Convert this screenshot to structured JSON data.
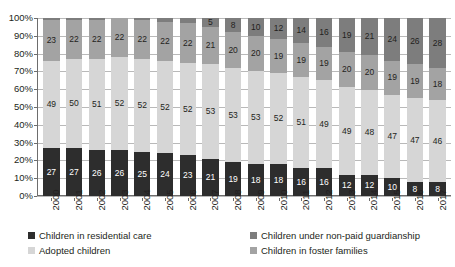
{
  "chart_data": {
    "type": "bar",
    "stacked": true,
    "stack_mode": "percent",
    "title": "",
    "subtitle": "",
    "xlabel": "",
    "ylabel": "",
    "ylim": [
      0,
      100
    ],
    "ytick_labels": [
      "100%",
      "90%",
      "80%",
      "70%",
      "60%",
      "50%",
      "40%",
      "30%",
      "20%",
      "10%",
      "0%"
    ],
    "ytick_values": [
      100,
      90,
      80,
      70,
      60,
      50,
      40,
      30,
      20,
      10,
      0
    ],
    "grid": true,
    "grid_axis": "y",
    "legend_position": "bottom",
    "categories": [
      "2000",
      "2001",
      "2002",
      "2003",
      "2004",
      "2005",
      "2006",
      "2007",
      "2008",
      "2009",
      "2010",
      "2011",
      "2012",
      "2013",
      "2014",
      "2015",
      "2016",
      "2017"
    ],
    "series": [
      {
        "name": "Children in residential care",
        "color": "#2d2d2d",
        "stack_index": 0,
        "values": [
          27,
          27,
          26,
          26,
          25,
          24,
          23,
          21,
          19,
          18,
          18,
          16,
          16,
          12,
          12,
          10,
          8,
          8
        ],
        "labels": [
          "27",
          "27",
          "26",
          "26",
          "25",
          "24",
          "23",
          "21",
          "19",
          "18",
          "18",
          "16",
          "16",
          "12",
          "12",
          "10",
          "8",
          "8"
        ]
      },
      {
        "name": "Adopted children",
        "color": "#d6d6d6",
        "stack_index": 1,
        "values": [
          49,
          50,
          51,
          52,
          52,
          52,
          52,
          53,
          53,
          53,
          52,
          51,
          49,
          49,
          48,
          47,
          47,
          46
        ],
        "labels": [
          "49",
          "50",
          "51",
          "52",
          "52",
          "52",
          "52",
          "53",
          "53",
          "53",
          "52",
          "51",
          "49",
          "49",
          "48",
          "47",
          "47",
          "46"
        ]
      },
      {
        "name": "Children in foster families",
        "color": "#a3a3a3",
        "stack_index": 2,
        "values": [
          23,
          22,
          22,
          22,
          22,
          22,
          22,
          21,
          20,
          20,
          19,
          19,
          19,
          20,
          20,
          19,
          19,
          18
        ],
        "labels": [
          "23",
          "22",
          "22",
          "22",
          "22",
          "22",
          "22",
          "21",
          "20",
          "20",
          "19",
          "19",
          "19",
          "20",
          "20",
          "19",
          "19",
          "18"
        ]
      },
      {
        "name": "Children under non-paid guardianship",
        "color": "#7d7d7d",
        "stack_index": 3,
        "values": [
          1,
          1,
          1,
          0,
          1,
          2,
          3,
          5,
          8,
          10,
          12,
          14,
          16,
          19,
          21,
          24,
          26,
          28
        ],
        "labels": [
          "",
          "",
          "",
          "",
          "",
          "",
          "3",
          "5",
          "8",
          "10",
          "12",
          "14",
          "16",
          "19",
          "21",
          "24",
          "26",
          "28"
        ]
      }
    ]
  },
  "legend": {
    "entries": [
      {
        "label": "Children in residential care",
        "color": "#2d2d2d"
      },
      {
        "label": "Children under non-paid guardianship",
        "color": "#7d7d7d"
      },
      {
        "label": "Adopted children",
        "color": "#d6d6d6"
      },
      {
        "label": "Children in foster families",
        "color": "#a3a3a3"
      }
    ]
  }
}
